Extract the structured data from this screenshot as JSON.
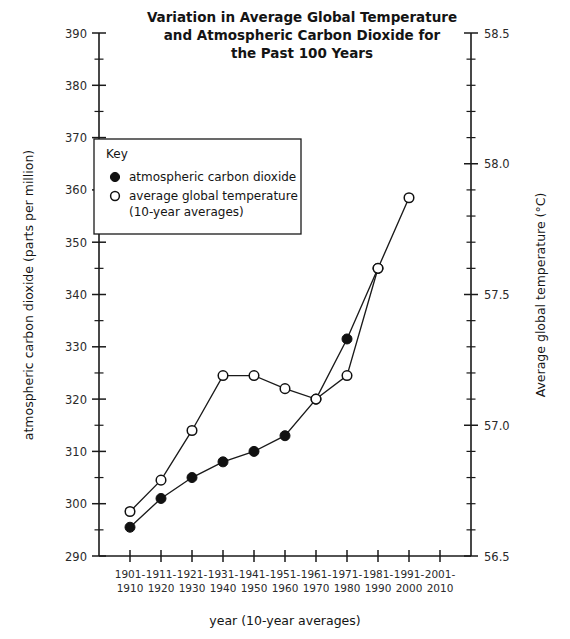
{
  "chart_data": {
    "type": "line",
    "title": "Variation in Average Global Temperature and Atmospheric Carbon Dioxide for the Past 100 Years",
    "title_lines": [
      "Variation in Average Global Temperature",
      "and Atmospheric Carbon Dioxide for",
      "the Past 100 Years"
    ],
    "xlabel": "year (10-year averages)",
    "ylabel": "atmospheric carbon dioxide (parts per million)",
    "y2label": "Average global temperature (°C)",
    "categories": [
      "1901-1910",
      "1911-1920",
      "1921-1930",
      "1931-1940",
      "1941-1950",
      "1951-1960",
      "1961-1970",
      "1971-1980",
      "1981-1990",
      "1991-2000",
      "2001-2010"
    ],
    "category_lines": [
      [
        "1901-",
        "1910"
      ],
      [
        "1911-",
        "1920"
      ],
      [
        "1921-",
        "1930"
      ],
      [
        "1931-",
        "1940"
      ],
      [
        "1941-",
        "1950"
      ],
      [
        "1951-",
        "1960"
      ],
      [
        "1961-",
        "1970"
      ],
      [
        "1971-",
        "1980"
      ],
      [
        "1981-",
        "1990"
      ],
      [
        "1991-",
        "2000"
      ],
      [
        "2001-",
        "2010"
      ]
    ],
    "ylim": [
      290,
      390
    ],
    "ytick_step": 10,
    "yminor_step": 5,
    "yticks": [
      290,
      300,
      310,
      320,
      330,
      340,
      350,
      360,
      370,
      380,
      390
    ],
    "ytick_labels": [
      "290",
      "300",
      "310",
      "320",
      "330",
      "340",
      "350",
      "360",
      "370",
      "380",
      "390"
    ],
    "y2lim": [
      56.5,
      58.5
    ],
    "y2tick_step": 0.5,
    "y2minor_step": 0.1,
    "y2ticks": [
      56.5,
      57.0,
      57.5,
      58.0,
      58.5
    ],
    "y2tick_labels": [
      "56.5",
      "57.0",
      "57.5",
      "58.0",
      "58.5"
    ],
    "grid": false,
    "legend_position": "upper-left-inside",
    "series": [
      {
        "name": "atmospheric carbon dioxide",
        "axis": "left",
        "marker": "filled-circle",
        "unit": "ppm",
        "values": [
          295.5,
          301.0,
          305.0,
          308.0,
          310.0,
          313.0,
          320.0,
          331.5,
          345.0,
          null,
          null
        ]
      },
      {
        "name": "average global temperature (10-year averages)",
        "axis": "right",
        "marker": "open-circle",
        "unit": "°C",
        "values": [
          56.67,
          56.79,
          56.98,
          57.19,
          57.19,
          57.14,
          57.1,
          57.19,
          57.6,
          57.87,
          null
        ],
        "values_left_equivalent": [
          298.5,
          304.5,
          314.5,
          328.0,
          328.3,
          325.3,
          322.3,
          328.3,
          350.0,
          358.5,
          null
        ]
      }
    ],
    "legend": {
      "title": "Key",
      "entries": [
        {
          "marker": "filled-circle",
          "label": "atmospheric carbon dioxide"
        },
        {
          "marker": "open-circle",
          "label": "average global temperature",
          "label2": "(10-year averages)"
        }
      ]
    },
    "colors": {
      "axis": "#1a1a1a",
      "line": "#1a1a1a",
      "filled_marker": "#111111",
      "open_marker_fill": "#ffffff",
      "background": "#ffffff"
    }
  }
}
